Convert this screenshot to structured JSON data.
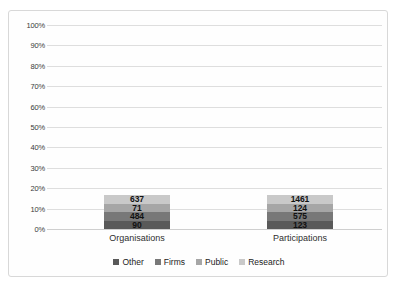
{
  "chart_data": {
    "type": "bar",
    "subtype": "100%-stacked-column",
    "title": "",
    "xlabel": "",
    "ylabel": "",
    "ylim": [
      0,
      100
    ],
    "ytick_labels": [
      "100%",
      "90%",
      "80%",
      "70%",
      "60%",
      "50%",
      "40%",
      "30%",
      "20%",
      "10%",
      "0%"
    ],
    "ytick_values": [
      100,
      90,
      80,
      70,
      60,
      50,
      40,
      30,
      20,
      10,
      0
    ],
    "grid": true,
    "legend_position": "bottom",
    "categories": [
      "Organisations",
      "Participations"
    ],
    "series": [
      {
        "name": "Other",
        "color": "#595959",
        "values": [
          90,
          123
        ],
        "percents": [
          7.0,
          5.4
        ]
      },
      {
        "name": "Firms",
        "color": "#787878",
        "values": [
          484,
          575
        ],
        "percents": [
          37.8,
          25.2
        ]
      },
      {
        "name": "Public",
        "color": "#a6a6a6",
        "values": [
          71,
          124
        ],
        "percents": [
          5.5,
          5.4
        ]
      },
      {
        "name": "Research",
        "color": "#c9c9c9",
        "values": [
          637,
          1461
        ],
        "percents": [
          49.7,
          64.0
        ]
      }
    ],
    "totals": [
      1282,
      2283
    ]
  }
}
